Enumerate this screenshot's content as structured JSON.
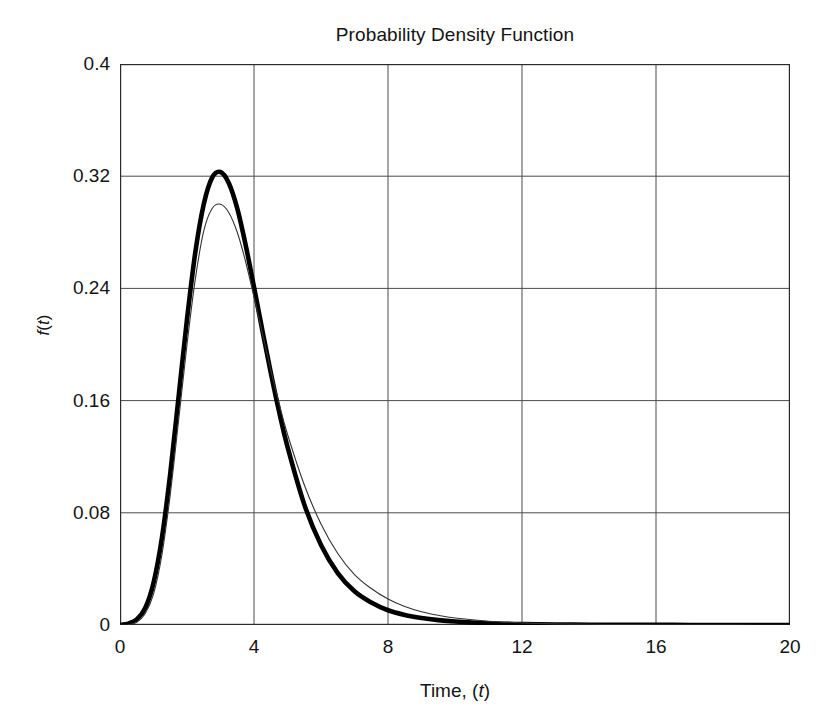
{
  "chart_data": {
    "type": "line",
    "title": "Probability Density Function",
    "xlabel": "Time, (t)",
    "ylabel": "f(t)",
    "xlim": [
      0,
      20
    ],
    "ylim": [
      0,
      0.4
    ],
    "grid": true,
    "legend_position": "none",
    "x_ticks": [
      "0",
      "4",
      "8",
      "12",
      "16",
      "20"
    ],
    "x_tick_values": [
      0,
      4,
      8,
      12,
      16,
      20
    ],
    "y_ticks": [
      "0",
      "0.08",
      "0.16",
      "0.24",
      "0.32",
      "0.4"
    ],
    "y_tick_values": [
      0,
      0.08,
      0.16,
      0.24,
      0.32,
      0.4
    ],
    "x": [
      0,
      0.25,
      0.5,
      0.75,
      1,
      1.25,
      1.5,
      1.75,
      2,
      2.25,
      2.5,
      2.75,
      3,
      3.25,
      3.5,
      3.75,
      4,
      4.25,
      4.5,
      4.75,
      5,
      5.5,
      6,
      6.5,
      7,
      7.5,
      8,
      8.5,
      9,
      9.5,
      10,
      11,
      12,
      13,
      14,
      15,
      16,
      17,
      18,
      19,
      20
    ],
    "series": [
      {
        "name": "thick-curve",
        "style": "thick-solid",
        "color": "#000000",
        "peak_x": 3.0,
        "peak_y": 0.323,
        "values": [
          0,
          0.001,
          0.004,
          0.012,
          0.03,
          0.062,
          0.108,
          0.163,
          0.218,
          0.266,
          0.3,
          0.319,
          0.323,
          0.315,
          0.297,
          0.271,
          0.241,
          0.21,
          0.18,
          0.152,
          0.127,
          0.086,
          0.057,
          0.037,
          0.024,
          0.016,
          0.0105,
          0.0072,
          0.005,
          0.0035,
          0.0025,
          0.0013,
          0.0007,
          0.0004,
          0.0002,
          0.00012,
          7e-05,
          4e-05,
          2e-05,
          1e-05,
          1e-05
        ]
      },
      {
        "name": "thin-curve",
        "style": "thin-solid",
        "color": "#333333",
        "peak_x": 2.9,
        "peak_y": 0.3,
        "values": [
          0,
          0.0002,
          0.002,
          0.008,
          0.022,
          0.05,
          0.093,
          0.146,
          0.2,
          0.247,
          0.281,
          0.297,
          0.3,
          0.294,
          0.28,
          0.259,
          0.234,
          0.208,
          0.182,
          0.158,
          0.136,
          0.1,
          0.072,
          0.051,
          0.036,
          0.026,
          0.0185,
          0.0132,
          0.0095,
          0.0069,
          0.005,
          0.0027,
          0.0015,
          0.0008,
          0.0005,
          0.0003,
          0.0002,
          0.00012,
          8e-05,
          5e-05,
          3e-05
        ]
      }
    ]
  }
}
